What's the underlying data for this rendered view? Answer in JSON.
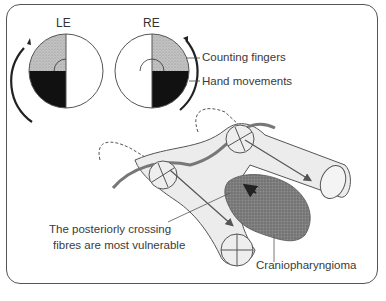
{
  "diagram": {
    "eyes": [
      {
        "id": "left",
        "label": "LE"
      },
      {
        "id": "right",
        "label": "RE"
      }
    ],
    "legend": {
      "counting_fingers": "Counting fingers",
      "hand_movements": "Hand movements"
    },
    "annotations": {
      "vulnerable_line1": "The posteriorly crossing",
      "vulnerable_line2": "fibres are most vulnerable",
      "tumour": "Craniopharyngioma"
    },
    "colors": {
      "stipple": "#b8b8b8",
      "black": "#111111",
      "nerve_fill": "#ececec",
      "outline": "#555555",
      "tumour": "#7a7a7a"
    }
  }
}
